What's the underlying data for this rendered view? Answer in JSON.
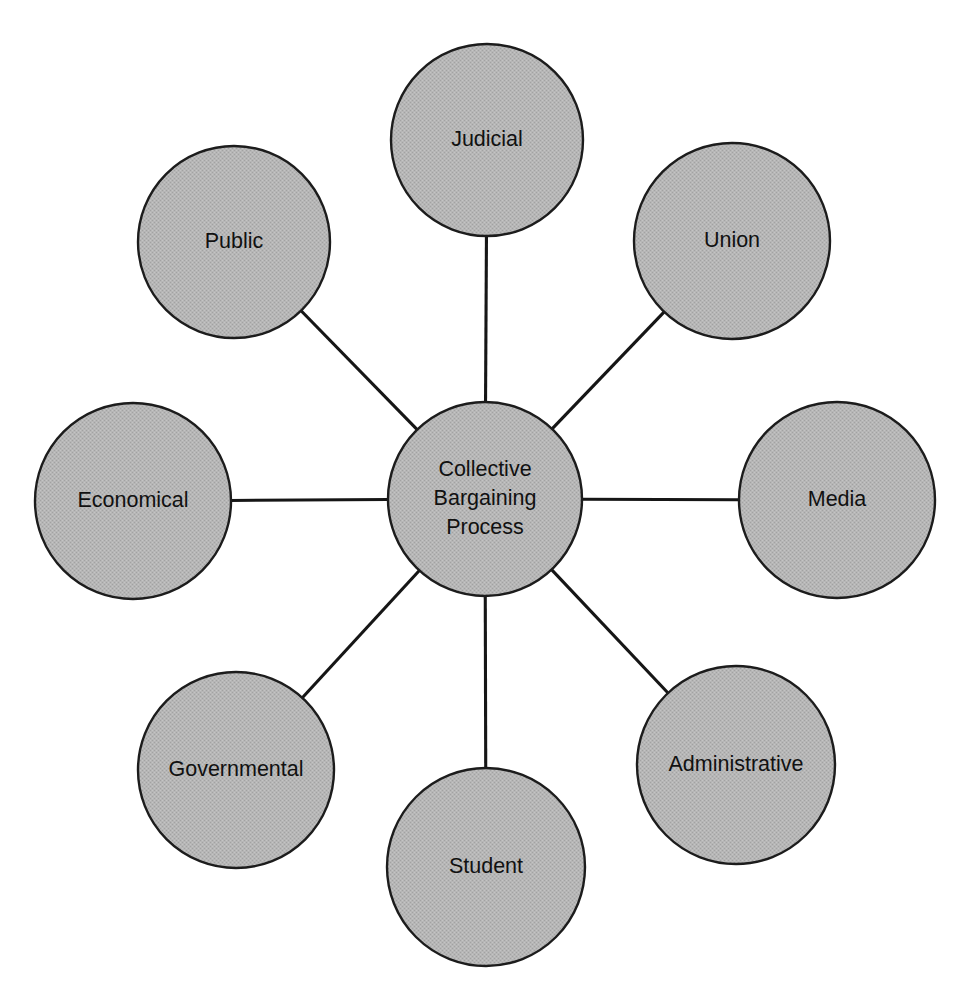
{
  "diagram": {
    "type": "radial-hub-and-spoke",
    "background_color": "#ffffff",
    "node_fill_color": "#b4b4b4",
    "node_stroke_color": "#1c1c1c",
    "connector_color": "#161616",
    "label_color": "#111111",
    "center_node": {
      "id": "collective-bargaining-process",
      "label_lines": [
        "Collective",
        "Bargaining",
        "Process"
      ],
      "label": "Collective Bargaining Process",
      "cx": 485,
      "cy": 499,
      "r": 97
    },
    "satellites": [
      {
        "id": "judicial",
        "label": "Judicial",
        "cx": 487,
        "cy": 140,
        "r": 96,
        "position": "top"
      },
      {
        "id": "union",
        "label": "Union",
        "cx": 732,
        "cy": 241,
        "r": 98,
        "position": "top-right"
      },
      {
        "id": "media",
        "label": "Media",
        "cx": 837,
        "cy": 500,
        "r": 98,
        "position": "right"
      },
      {
        "id": "administrative",
        "label": "Administrative",
        "cx": 736,
        "cy": 765,
        "r": 99,
        "position": "bottom-right"
      },
      {
        "id": "student",
        "label": "Student",
        "cx": 486,
        "cy": 867,
        "r": 99,
        "position": "bottom"
      },
      {
        "id": "governmental",
        "label": "Governmental",
        "cx": 236,
        "cy": 770,
        "r": 98,
        "position": "bottom-left"
      },
      {
        "id": "economical",
        "label": "Economical",
        "cx": 133,
        "cy": 501,
        "r": 98,
        "position": "left"
      },
      {
        "id": "public",
        "label": "Public",
        "cx": 234,
        "cy": 242,
        "r": 96,
        "position": "top-left"
      }
    ],
    "connections": [
      {
        "from": "collective-bargaining-process",
        "to": "judicial"
      },
      {
        "from": "collective-bargaining-process",
        "to": "union"
      },
      {
        "from": "collective-bargaining-process",
        "to": "media"
      },
      {
        "from": "collective-bargaining-process",
        "to": "administrative"
      },
      {
        "from": "collective-bargaining-process",
        "to": "student"
      },
      {
        "from": "collective-bargaining-process",
        "to": "governmental"
      },
      {
        "from": "collective-bargaining-process",
        "to": "economical"
      },
      {
        "from": "collective-bargaining-process",
        "to": "public"
      }
    ]
  }
}
